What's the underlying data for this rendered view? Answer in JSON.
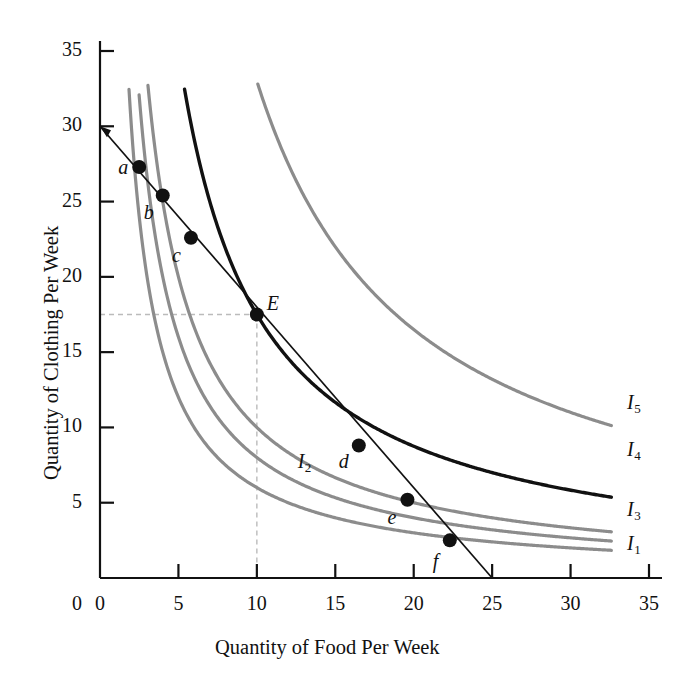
{
  "chart_data": {
    "type": "line",
    "title": "",
    "xlabel": "Quantity of Food Per Week",
    "ylabel": "Quantity of Clothing Per Week",
    "xlim": [
      0,
      35
    ],
    "ylim": [
      0,
      35
    ],
    "grid": false,
    "xticks": [
      "0",
      "5",
      "10",
      "15",
      "20",
      "25",
      "30",
      "35"
    ],
    "yticks": [
      "0",
      "5",
      "10",
      "15",
      "20",
      "25",
      "30",
      "35"
    ],
    "xtick_values": [
      0,
      5,
      10,
      15,
      20,
      25,
      30,
      35
    ],
    "ytick_values": [
      0,
      5,
      10,
      15,
      20,
      25,
      30,
      35
    ],
    "legend_position": "right-inline",
    "budget_line": {
      "name": "Budget Line",
      "x": [
        0,
        25
      ],
      "y": [
        30,
        0
      ],
      "color": "#111111",
      "x_intercept": 25,
      "y_intercept": 30
    },
    "series": [
      {
        "name": "I1",
        "label": "I",
        "subscript": "1",
        "color": "#8c8c8c",
        "highlighted": false,
        "constant": 60,
        "label_x": 33.6,
        "label_y": 2.1
      },
      {
        "name": "I2",
        "label": "I",
        "subscript": "2",
        "color": "#8c8c8c",
        "highlighted": false,
        "constant": 80,
        "label_x": 12.6,
        "label_y": 7.6
      },
      {
        "name": "I3",
        "label": "I",
        "subscript": "3",
        "color": "#8c8c8c",
        "highlighted": false,
        "constant": 100,
        "label_x": 33.6,
        "label_y": 4.4
      },
      {
        "name": "I4",
        "label": "I",
        "subscript": "4",
        "color": "#111111",
        "highlighted": true,
        "constant": 175,
        "label_x": 33.6,
        "label_y": 8.4
      },
      {
        "name": "I5",
        "label": "I",
        "subscript": "5",
        "color": "#8c8c8c",
        "highlighted": false,
        "constant": 330,
        "label_x": 33.6,
        "label_y": 11.5
      }
    ],
    "points": [
      {
        "label": "a",
        "x": 2.5,
        "y": 27.3,
        "on_curve": "I1",
        "label_dx": -21,
        "label_dy": 3
      },
      {
        "label": "b",
        "x": 4.0,
        "y": 25.4,
        "on_curve": "I2",
        "label_dx": -19,
        "label_dy": 19
      },
      {
        "label": "c",
        "x": 5.8,
        "y": 22.6,
        "on_curve": "I3",
        "label_dx": -19,
        "label_dy": 20
      },
      {
        "label": "E",
        "x": 10.0,
        "y": 17.5,
        "on_curve": "I4",
        "label_dx": 10,
        "label_dy": -9
      },
      {
        "label": "d",
        "x": 16.5,
        "y": 8.8,
        "on_curve": "I3",
        "label_dx": -20,
        "label_dy": 19
      },
      {
        "label": "e",
        "x": 19.6,
        "y": 5.2,
        "on_curve": "I2",
        "label_dx": -20,
        "label_dy": 20
      },
      {
        "label": "f",
        "x": 22.3,
        "y": 2.5,
        "on_curve": "I1",
        "label_dx": -17,
        "label_dy": 24
      }
    ],
    "equilibrium": {
      "point_label": "E",
      "x": 10.0,
      "y": 17.5,
      "dashed_guides": true
    },
    "colors": {
      "curve_gray": "#8c8c8c",
      "curve_black": "#111111",
      "axis": "#111111",
      "dashed_guide": "#bbbbbb",
      "background": "#ffffff"
    }
  }
}
